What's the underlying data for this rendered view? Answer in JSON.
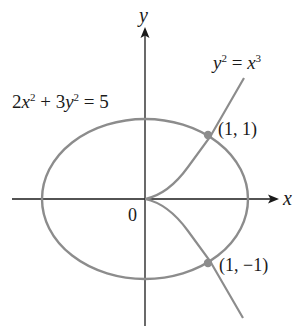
{
  "figure": {
    "axes": {
      "x_label": "x",
      "y_label": "y",
      "origin_label": "0"
    },
    "curves": [
      {
        "name": "ellipse",
        "equation_parts": {
          "a": "2",
          "x": "x",
          "b": "+ 3",
          "y": "y",
          "rhs": "= 5"
        },
        "equation": "2x^2 + 3y^2 = 5"
      },
      {
        "name": "cusp",
        "equation_parts": {
          "y": "y",
          "eq": " = ",
          "x": "x"
        },
        "equation": "y^2 = x^3"
      }
    ],
    "points": [
      {
        "label": "(1, 1)",
        "x": 1,
        "y": 1
      },
      {
        "label": "(1, −1)",
        "x": 1,
        "y": -1
      }
    ],
    "exponents": {
      "sq": "2",
      "cube": "3"
    },
    "colors": {
      "curve": "#8c8c8c",
      "axis": "#1a1a1a",
      "point": "#8c8c8c"
    }
  }
}
